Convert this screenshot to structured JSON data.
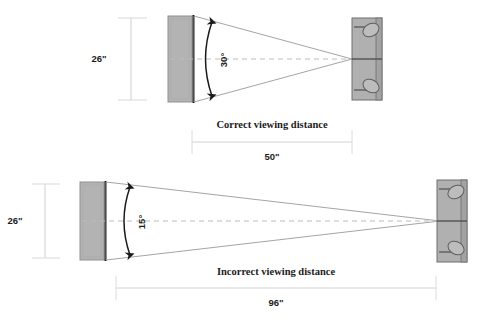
{
  "diagram": {
    "title_present": false,
    "background_color": "#ffffff",
    "screen_fill": "#b3b3b3",
    "screen_stroke": "#8c8c8c",
    "screen_edge_color": "#1a1a1a",
    "seat_fill": "#b0b0b0",
    "seat_stroke": "#6e6e6e",
    "cone_line_color": "#9a9a9a",
    "dimension_line_color": "#d2d2d2",
    "centerline_color": "#bcbcbc",
    "arc_color": "#1a1a1a",
    "text_color": "#1c1c1c",
    "panels": [
      {
        "id": "correct",
        "height_label": "26\"",
        "angle_label": "30°",
        "caption": "Correct viewing distance",
        "distance_label": "50\""
      },
      {
        "id": "incorrect",
        "height_label": "26\"",
        "angle_label": "15°",
        "caption": "Incorrect viewing distance",
        "distance_label": "96\""
      }
    ]
  }
}
